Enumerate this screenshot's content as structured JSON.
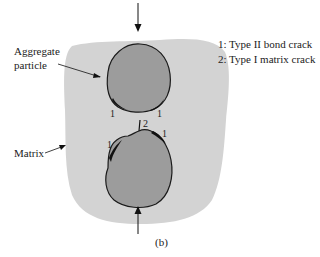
{
  "figure": {
    "caption": "(b)",
    "labels": {
      "aggregate_line1": "Aggregate",
      "aggregate_line2": "particle",
      "matrix": "Matrix"
    },
    "legend": {
      "item1": "1: Type II bond crack",
      "item2": "2: Type I matrix crack"
    },
    "crack_marks": {
      "upper_left": "1",
      "upper_right": "1",
      "lower_left": "1",
      "lower_right": "1",
      "matrix_crack": "2"
    },
    "colors": {
      "matrix": "#d3d3d3",
      "particle": "#9c9c9c",
      "outline": "#1a1a1a",
      "background": "#ffffff"
    }
  }
}
